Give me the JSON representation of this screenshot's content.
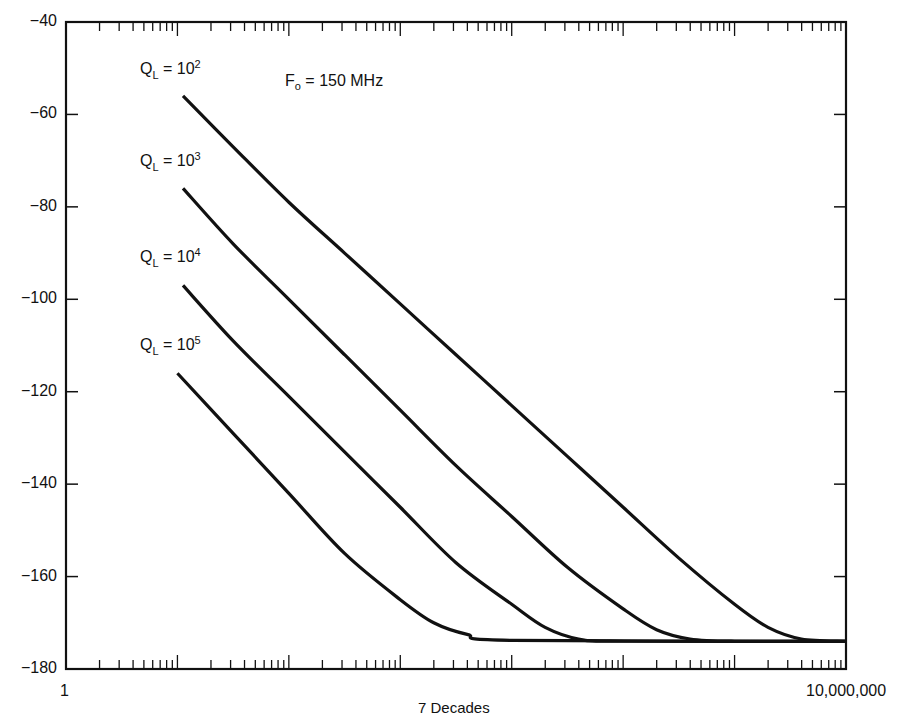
{
  "chart_data": {
    "type": "line",
    "title": "",
    "xlabel": "7 Decades",
    "ylabel": "",
    "x_scale": "log",
    "xlim": [
      1,
      10000000
    ],
    "ylim": [
      -180,
      -40
    ],
    "x_tick_labels": {
      "left": "1",
      "right": "10,000,000"
    },
    "y_ticks": [
      -40,
      -60,
      -80,
      -100,
      -120,
      -140,
      -160,
      -180
    ],
    "y_tick_labels": [
      "−40",
      "−60",
      "−80",
      "−100",
      "−120",
      "−140",
      "−160",
      "−180"
    ],
    "grid": false,
    "annotation": {
      "text": "F",
      "sub": "o",
      "rest": " = 150 MHz"
    },
    "series": [
      {
        "name": "QL = 10^2",
        "label_base": "Q",
        "label_sub": "L",
        "label_eq": " = 10",
        "label_exp": "2",
        "points_decade_db": [
          [
            1.05,
            -56
          ],
          [
            1.5,
            -67
          ],
          [
            2,
            -79
          ],
          [
            2.5,
            -90
          ],
          [
            3,
            -101
          ],
          [
            3.5,
            -112
          ],
          [
            4,
            -123
          ],
          [
            4.5,
            -134
          ],
          [
            5,
            -145
          ],
          [
            5.5,
            -156
          ],
          [
            6,
            -166
          ],
          [
            6.3,
            -171
          ],
          [
            6.6,
            -173.5
          ],
          [
            7,
            -174
          ]
        ]
      },
      {
        "name": "QL = 10^3",
        "label_base": "Q",
        "label_sub": "L",
        "label_eq": " = 10",
        "label_exp": "3",
        "points_decade_db": [
          [
            1.05,
            -76
          ],
          [
            1.5,
            -88
          ],
          [
            2,
            -100
          ],
          [
            2.5,
            -112
          ],
          [
            3,
            -124
          ],
          [
            3.5,
            -136
          ],
          [
            4,
            -147
          ],
          [
            4.5,
            -158
          ],
          [
            5,
            -167
          ],
          [
            5.3,
            -171.5
          ],
          [
            5.6,
            -173.5
          ],
          [
            6,
            -174
          ],
          [
            7,
            -174
          ]
        ]
      },
      {
        "name": "QL = 10^4",
        "label_base": "Q",
        "label_sub": "L",
        "label_eq": " = 10",
        "label_exp": "4",
        "points_decade_db": [
          [
            1.05,
            -97
          ],
          [
            1.5,
            -109
          ],
          [
            2,
            -121
          ],
          [
            2.5,
            -133
          ],
          [
            3,
            -145
          ],
          [
            3.5,
            -157
          ],
          [
            4,
            -166
          ],
          [
            4.3,
            -171
          ],
          [
            4.6,
            -173.5
          ],
          [
            5,
            -174
          ],
          [
            7,
            -174
          ]
        ]
      },
      {
        "name": "QL = 10^5",
        "label_base": "Q",
        "label_sub": "L",
        "label_eq": " = 10",
        "label_exp": "5",
        "points_decade_db": [
          [
            1.0,
            -116
          ],
          [
            1.5,
            -129
          ],
          [
            2,
            -142
          ],
          [
            2.5,
            -155
          ],
          [
            3,
            -165
          ],
          [
            3.3,
            -170
          ],
          [
            3.6,
            -172.5
          ],
          [
            4,
            -173.8
          ],
          [
            7,
            -174
          ]
        ]
      }
    ]
  }
}
